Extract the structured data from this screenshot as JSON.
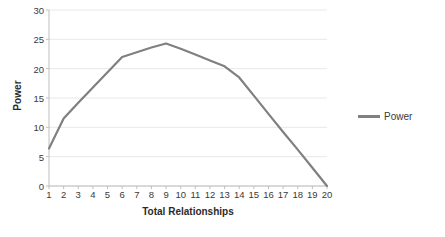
{
  "chart_data": {
    "type": "line",
    "title": "",
    "subtitle": "",
    "xlabel": "Total Relationships",
    "ylabel": "Power",
    "x": [
      1,
      2,
      3,
      4,
      5,
      6,
      7,
      8,
      9,
      10,
      11,
      12,
      13,
      14,
      15,
      16,
      17,
      18,
      19,
      20
    ],
    "xtick_labels": [
      "1",
      "2",
      "3",
      "4",
      "5",
      "6",
      "7",
      "8",
      "9",
      "10",
      "11",
      "12",
      "13",
      "14",
      "15",
      "16",
      "17",
      "18",
      "19",
      "20"
    ],
    "ytick_labels": [
      "0",
      "5",
      "10",
      "15",
      "20",
      "25",
      "30"
    ],
    "yticks": [
      0,
      5,
      10,
      15,
      20,
      25,
      30
    ],
    "xlim": [
      1,
      20
    ],
    "ylim": [
      0,
      30
    ],
    "grid": "horizontal",
    "legend_position": "right",
    "series": [
      {
        "name": "Power",
        "color": "#808080",
        "values": [
          6.4,
          11.5,
          14.2,
          16.8,
          19.4,
          22.0,
          22.8,
          23.6,
          24.3,
          23.4,
          22.4,
          21.4,
          20.4,
          18.5,
          15.4,
          12.3,
          9.2,
          6.2,
          3.1,
          0.0
        ]
      }
    ]
  },
  "legend": {
    "items": [
      {
        "label": "Power",
        "color": "#808080"
      }
    ]
  },
  "colors": {
    "series_line": "#808080",
    "gridline": "#e8e8e8",
    "axis_line": "#bfbfbf",
    "text": "#3a3a3a",
    "title_text": "#2b2b2b",
    "background": "#ffffff"
  }
}
